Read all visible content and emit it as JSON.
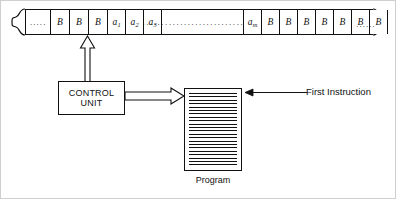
{
  "tape": {
    "name": "input-tape",
    "left_edge": "brace-left",
    "right_edge": "brace-right",
    "left_ellipsis": "·····",
    "right_ellipsis": "······",
    "middle_ellipsis": "································",
    "cells": [
      {
        "label": "·····",
        "type": "ellipsis"
      },
      {
        "label": "B",
        "sub": "",
        "type": "blank"
      },
      {
        "label": "B",
        "sub": "",
        "type": "blank"
      },
      {
        "label": "B",
        "sub": "",
        "type": "blank"
      },
      {
        "label": "a",
        "sub": "1",
        "type": "symbol"
      },
      {
        "label": "a",
        "sub": "2",
        "type": "symbol"
      },
      {
        "label": "a",
        "sub": "3",
        "type": "symbol"
      },
      {
        "label": "································",
        "type": "ellipsis-wide"
      },
      {
        "label": "a",
        "sub": "m",
        "type": "symbol"
      },
      {
        "label": "B",
        "sub": "",
        "type": "blank"
      },
      {
        "label": "B",
        "sub": "",
        "type": "blank"
      },
      {
        "label": "B",
        "sub": "",
        "type": "blank"
      },
      {
        "label": "B",
        "sub": "",
        "type": "blank"
      },
      {
        "label": "B",
        "sub": "",
        "type": "blank"
      },
      {
        "label": "B",
        "sub": "",
        "type": "blank"
      },
      {
        "label": "B",
        "sub": "",
        "type": "blank"
      },
      {
        "label": "······",
        "type": "ellipsis"
      }
    ]
  },
  "control_unit": {
    "line1": "CONTROL",
    "line2": "UNIT"
  },
  "program": {
    "label": "Program"
  },
  "annotation": {
    "first_instruction": "First Instruction"
  },
  "colors": {
    "ink": "#111111",
    "paper": "#ffffff",
    "frame": "#cfcfcf"
  }
}
